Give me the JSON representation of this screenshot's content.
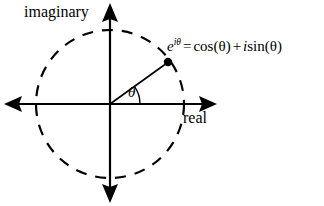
{
  "figure": {
    "background_color": "#ffffff",
    "stroke_color": "#000000",
    "width": 324,
    "height": 206,
    "axes": {
      "imaginary_label": "imaginary",
      "real_label": "real"
    },
    "angle_label": "θ",
    "formula": {
      "base": "e",
      "exponent": "iθ",
      "equals": "=",
      "cos_term": "cos(θ)",
      "plus": "+",
      "imaginary_unit": "i",
      "sin_term": "sin(θ)",
      "full_text": "e^{iθ} = cos(θ) + i sin(θ)"
    },
    "geometry": {
      "origin_x": 110,
      "origin_y": 104,
      "circle_radius": 74,
      "circle_style": "dashed",
      "point_x": 168,
      "point_y": 62,
      "angle_degrees": 36,
      "arc_radius": 30,
      "axis_left_x": 5,
      "axis_right_x": 217,
      "axis_top_y": 4,
      "axis_bottom_y": 202
    }
  }
}
